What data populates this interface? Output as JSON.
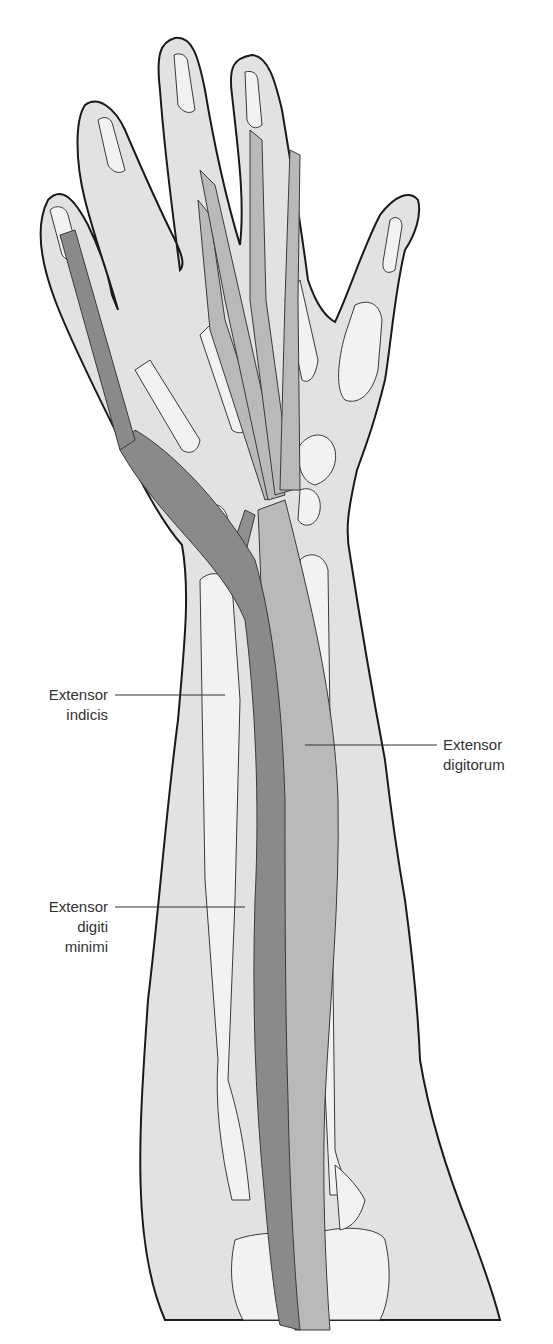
{
  "figure": {
    "colors": {
      "skin": "#e2e2e2",
      "skin_outline": "#1a1a1a",
      "bone": "#f2f2f2",
      "bone_outline": "#3a3a3a",
      "extensor_digitorum": "#b9b9b9",
      "extensor_digiti_minimi": "#8a8a8a",
      "extensor_indicis": "#8f8f8f",
      "leader_line": "#333333",
      "label_text": "#333333"
    }
  },
  "labels": {
    "extensor_indicis": {
      "line1": "Extensor",
      "line2": "indicis"
    },
    "extensor_digitorum": {
      "line1": "Extensor",
      "line2": "digitorum"
    },
    "extensor_digiti_minimi": {
      "line1": "Extensor",
      "line2": "digiti",
      "line3": "minimi"
    }
  }
}
